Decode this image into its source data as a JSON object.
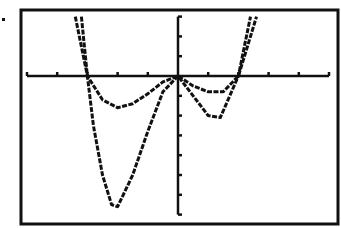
{
  "chart_data": {
    "type": "line",
    "title": "",
    "xlabel": "",
    "ylabel": "",
    "xlim": [
      -5,
      5
    ],
    "ylim": [
      -7,
      3
    ],
    "grid": false,
    "legend": null,
    "style": "graphing calculator screen, monochrome pixel plot",
    "axes": {
      "x_ticks": [
        -5,
        -4,
        -3,
        -2,
        -1,
        1,
        2,
        3,
        4,
        5
      ],
      "y_ticks": [
        -7,
        -6,
        -5,
        -4,
        -3,
        -2,
        -1,
        1,
        2,
        3
      ]
    },
    "series": [
      {
        "name": "y1 (shallow quartic)",
        "x": [
          -3.4,
          -3.0,
          -2.5,
          -2.0,
          -1.5,
          -1.0,
          -0.5,
          0,
          0.5,
          1.0,
          1.5,
          2.0,
          2.3,
          2.6
        ],
        "values": [
          3.0,
          0.0,
          -1.2,
          -1.6,
          -1.4,
          -0.9,
          -0.3,
          0.0,
          -0.5,
          -0.8,
          -0.8,
          0.0,
          1.5,
          3.0
        ]
      },
      {
        "name": "y2 (deep quartic)",
        "x": [
          -3.2,
          -3.0,
          -2.8,
          -2.5,
          -2.2,
          -2.0,
          -1.5,
          -1.0,
          -0.5,
          0,
          0.5,
          1.0,
          1.4,
          2.0,
          2.2,
          2.4
        ],
        "values": [
          3.0,
          0.0,
          -2.5,
          -5.0,
          -6.5,
          -6.6,
          -5.0,
          -2.8,
          -0.8,
          0.0,
          -1.0,
          -2.0,
          -2.1,
          0.0,
          1.5,
          3.0
        ]
      }
    ]
  },
  "colors": {
    "background": "#ffffff",
    "ink": "#111111"
  }
}
